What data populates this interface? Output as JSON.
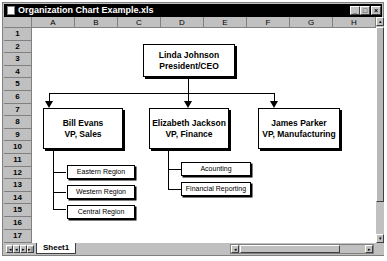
{
  "window": {
    "title": "Organization Chart Example.xls",
    "controls": {
      "minimize": "_",
      "maximize": "□",
      "close": "×"
    }
  },
  "grid": {
    "columns": [
      "A",
      "B",
      "C",
      "D",
      "E",
      "F",
      "G",
      "H"
    ],
    "rows": [
      "1",
      "2",
      "3",
      "4",
      "5",
      "6",
      "7",
      "8",
      "9",
      "10",
      "11",
      "12",
      "13",
      "14",
      "15",
      "16",
      "17"
    ]
  },
  "org_chart": {
    "ceo": {
      "name": "Linda Johnson",
      "title": "President/CEO"
    },
    "vps": [
      {
        "name": "Bill Evans",
        "title": "VP, Sales",
        "departments": [
          "Eastern Region",
          "Western Region",
          "Central Region"
        ]
      },
      {
        "name": "Elizabeth Jackson",
        "title": "VP, Finance",
        "departments": [
          "Acounting",
          "Financial Reporting"
        ]
      },
      {
        "name": "James Parker",
        "title": "VP, Manufacturing",
        "departments": []
      }
    ]
  },
  "sheet_tabs": {
    "active": "Sheet1"
  },
  "tab_nav": {
    "first": "|◂",
    "prev": "◂",
    "next": "▸",
    "last": "▸|"
  },
  "scrollbar": {
    "up": "▴",
    "down": "▾",
    "left": "◂",
    "right": "▸"
  }
}
